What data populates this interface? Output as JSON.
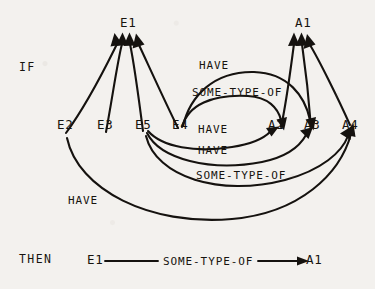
{
  "figure": {
    "kind": "semantic-network-rule-diagram",
    "background_color": "#f3f1ee",
    "ink_color": "#15120f"
  },
  "keywords": {
    "if": "IF",
    "then": "THEN"
  },
  "nodes": {
    "e1": "E1",
    "e2": "E2",
    "e3": "E3",
    "e4": "E4",
    "e5": "E5",
    "a1": "A1",
    "a2": "A2",
    "a3": "A3",
    "a4": "A4"
  },
  "relations": {
    "have": "HAVE",
    "some_type_of": "SOME-TYPE-OF"
  },
  "antecedent_edges": [
    {
      "id": "e2-e1",
      "from": "E2",
      "to": "E1",
      "label": ""
    },
    {
      "id": "e3-e1",
      "from": "E3",
      "to": "E1",
      "label": ""
    },
    {
      "id": "e5-e1",
      "from": "E5",
      "to": "E1",
      "label": ""
    },
    {
      "id": "e4-e1",
      "from": "E4",
      "to": "E1",
      "label": ""
    },
    {
      "id": "a2-a1",
      "from": "A2",
      "to": "A1",
      "label": ""
    },
    {
      "id": "a3-a1",
      "from": "A3",
      "to": "A1",
      "label": ""
    },
    {
      "id": "a4-a1",
      "from": "A4",
      "to": "A1",
      "label": ""
    },
    {
      "id": "e4-a3-have",
      "from": "E4",
      "to": "A3",
      "label": "HAVE"
    },
    {
      "id": "e4-a2-stof",
      "from": "E4",
      "to": "A2",
      "label": "SOME-TYPE-OF"
    },
    {
      "id": "e5-a2-have",
      "from": "E5",
      "to": "A2",
      "label": "HAVE"
    },
    {
      "id": "e5-a3-have",
      "from": "E5",
      "to": "A3",
      "label": "HAVE"
    },
    {
      "id": "e5-a4-stof",
      "from": "E5",
      "to": "A4",
      "label": "SOME-TYPE-OF"
    },
    {
      "id": "e2-a4-have",
      "from": "E2",
      "to": "A4",
      "label": "HAVE"
    }
  ],
  "edge_labels": {
    "have_top": "HAVE",
    "some_type_of_top": "SOME-TYPE-OF",
    "have_mid1": "HAVE",
    "have_mid2": "HAVE",
    "some_type_of_mid": "SOME-TYPE-OF",
    "have_bottom": "HAVE"
  },
  "consequent": {
    "subject": "E1",
    "relation": "SOME-TYPE-OF",
    "object": "A1"
  }
}
